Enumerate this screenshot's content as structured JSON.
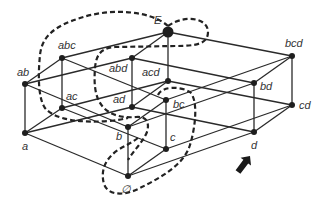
{
  "diagram": {
    "title": "",
    "colors": {
      "line": "#2a2a2a",
      "node": "#1e1e1e",
      "label": "#333333",
      "background": "#ffffff"
    },
    "nodes": [
      {
        "id": "E",
        "label": "E",
        "x": 168,
        "y": 32,
        "r": 5.5,
        "lx": 154,
        "ly": 24
      },
      {
        "id": "abc",
        "label": "abc",
        "x": 62,
        "y": 58,
        "r": 3,
        "lx": 58,
        "ly": 49
      },
      {
        "id": "abd",
        "label": "abd",
        "x": 132,
        "y": 58,
        "r": 3,
        "lx": 109,
        "ly": 72
      },
      {
        "id": "acd",
        "label": "acd",
        "x": 168,
        "y": 81,
        "r": 3,
        "lx": 142,
        "ly": 76
      },
      {
        "id": "bcd",
        "label": "bcd",
        "x": 292,
        "y": 56,
        "r": 3,
        "lx": 285,
        "ly": 47
      },
      {
        "id": "ab",
        "label": "ab",
        "x": 25,
        "y": 84,
        "r": 3,
        "lx": 17,
        "ly": 76
      },
      {
        "id": "ac",
        "label": "ac",
        "x": 62,
        "y": 108,
        "r": 3,
        "lx": 66,
        "ly": 100
      },
      {
        "id": "ad",
        "label": "ad",
        "x": 132,
        "y": 107,
        "r": 3,
        "lx": 113,
        "ly": 103
      },
      {
        "id": "bc",
        "label": "bc",
        "x": 166,
        "y": 100,
        "r": 3,
        "lx": 173,
        "ly": 108
      },
      {
        "id": "bd",
        "label": "bd",
        "x": 254,
        "y": 83,
        "r": 3,
        "lx": 260,
        "ly": 90
      },
      {
        "id": "cd",
        "label": "cd",
        "x": 292,
        "y": 105,
        "r": 3,
        "lx": 299,
        "ly": 109
      },
      {
        "id": "a",
        "label": "a",
        "x": 25,
        "y": 133,
        "r": 3,
        "lx": 22,
        "ly": 150
      },
      {
        "id": "b",
        "label": "b",
        "x": 128,
        "y": 127,
        "r": 3,
        "lx": 116,
        "ly": 140
      },
      {
        "id": "c",
        "label": "c",
        "x": 166,
        "y": 149,
        "r": 3,
        "lx": 170,
        "ly": 141
      },
      {
        "id": "d",
        "label": "d",
        "x": 254,
        "y": 132,
        "r": 3,
        "lx": 251,
        "ly": 149
      },
      {
        "id": "empty",
        "label": "∅",
        "x": 128,
        "y": 176,
        "r": 3,
        "lx": 121,
        "ly": 193
      }
    ],
    "edges": [
      [
        "E",
        "abc"
      ],
      [
        "E",
        "abd"
      ],
      [
        "E",
        "acd"
      ],
      [
        "E",
        "bcd"
      ],
      [
        "abc",
        "ab"
      ],
      [
        "abc",
        "ac"
      ],
      [
        "abc",
        "bc"
      ],
      [
        "abd",
        "ab"
      ],
      [
        "abd",
        "ad"
      ],
      [
        "abd",
        "bd"
      ],
      [
        "acd",
        "ac"
      ],
      [
        "acd",
        "ad"
      ],
      [
        "acd",
        "cd"
      ],
      [
        "bcd",
        "bc"
      ],
      [
        "bcd",
        "bd"
      ],
      [
        "bcd",
        "cd"
      ],
      [
        "ab",
        "a"
      ],
      [
        "ab",
        "b"
      ],
      [
        "ac",
        "a"
      ],
      [
        "ac",
        "c"
      ],
      [
        "ad",
        "a"
      ],
      [
        "ad",
        "d"
      ],
      [
        "bc",
        "b"
      ],
      [
        "bc",
        "c"
      ],
      [
        "bd",
        "b"
      ],
      [
        "bd",
        "d"
      ],
      [
        "cd",
        "c"
      ],
      [
        "cd",
        "d"
      ],
      [
        "a",
        "empty"
      ],
      [
        "b",
        "empty"
      ],
      [
        "c",
        "empty"
      ],
      [
        "d",
        "empty"
      ]
    ],
    "dashed_regions": [
      {
        "name": "outer-region",
        "path": "M168,26 C185,14 208,18 208,32 C208,44 196,46 175,46 L115,47 C100,48 96,56 95,68 C94,82 94,98 104,108 C112,116 124,118 136,117 C146,116 150,122 147,132 C143,142 134,150 128,160 M168,26 C150,10 110,8 80,18 C55,26 42,36 40,55 C38,75 38,98 45,108 C55,120 80,123 110,121 C118,120 124,119 128,118"
      },
      {
        "name": "bc-region",
        "path": "M158,95 C162,86 180,86 190,92 C198,100 196,125 190,145 C184,165 160,178 140,188 C125,196 108,196 104,184 C100,170 106,158 118,150 C126,145 134,142 140,136"
      }
    ],
    "arrow": {
      "name": "direction-arrow",
      "tail_x": 238,
      "tail_y": 172,
      "head_x": 250,
      "head_y": 156
    }
  }
}
